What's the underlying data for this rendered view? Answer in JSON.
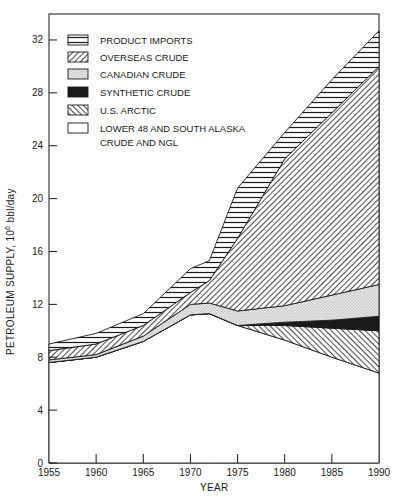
{
  "chart_data": {
    "type": "area",
    "stacked": true,
    "title": "",
    "xlabel": "YEAR",
    "ylabel": "PETROLEUM SUPPLY, 10^6 bbl/day",
    "ylabel_parts": {
      "main": "PETROLEUM SUPPLY, 10",
      "sup": "6",
      "unit": " bbl/day"
    },
    "xlim": [
      1955,
      1990
    ],
    "ylim": [
      0,
      33.5
    ],
    "x_ticks": [
      1955,
      1960,
      1965,
      1970,
      1975,
      1980,
      1985,
      1990
    ],
    "y_ticks": [
      0,
      4,
      8,
      12,
      16,
      20,
      24,
      28,
      32
    ],
    "grid": false,
    "legend_position": "upper-left inside",
    "x": [
      1955,
      1960,
      1965,
      1970,
      1972,
      1975,
      1980,
      1985,
      1990
    ],
    "series": [
      {
        "name": "LOWER 48 AND SOUTH ALASKA CRUDE AND NGL",
        "pattern": "blank",
        "values": [
          7.6,
          8.0,
          9.2,
          11.2,
          11.3,
          10.4,
          9.3,
          8.0,
          6.8
        ]
      },
      {
        "name": "U.S. ARCTIC",
        "pattern": "back-hatch",
        "values": [
          0,
          0,
          0,
          0,
          0,
          0.0,
          1.1,
          2.2,
          3.2
        ]
      },
      {
        "name": "SYNTHETIC CRUDE",
        "pattern": "solid-black",
        "values": [
          0,
          0,
          0,
          0,
          0,
          0,
          0.25,
          0.6,
          1.1
        ]
      },
      {
        "name": "CANADIAN CRUDE",
        "pattern": "stipple",
        "values": [
          0.2,
          0.2,
          0.4,
          0.8,
          0.8,
          1.1,
          1.25,
          1.9,
          2.4
        ]
      },
      {
        "name": "OVERSEAS CRUDE",
        "pattern": "forward-hatch",
        "values": [
          0.7,
          0.8,
          0.8,
          0.9,
          1.7,
          5.5,
          11.1,
          13.8,
          16.5
        ]
      },
      {
        "name": "PRODUCT IMPORTS",
        "pattern": "horizontal-lines",
        "values": [
          0.5,
          0.8,
          0.9,
          1.8,
          1.5,
          3.8,
          2.0,
          2.5,
          2.7
        ]
      }
    ],
    "cumulative_tops": {
      "lower48": [
        7.6,
        8.0,
        9.2,
        11.2,
        11.3,
        10.4,
        9.3,
        8.0,
        6.8
      ],
      "arctic": [
        7.6,
        8.0,
        9.2,
        11.2,
        11.3,
        10.4,
        10.4,
        10.2,
        10.0
      ],
      "synthetic": [
        7.6,
        8.0,
        9.2,
        11.2,
        11.3,
        10.4,
        10.65,
        10.8,
        11.1
      ],
      "canadian": [
        7.8,
        8.2,
        9.6,
        12.0,
        12.1,
        11.5,
        11.9,
        12.7,
        13.5
      ],
      "overseas": [
        8.5,
        9.0,
        10.4,
        12.9,
        13.8,
        17.0,
        23.0,
        26.5,
        30.0
      ],
      "product": [
        9.0,
        9.8,
        11.3,
        14.7,
        15.3,
        20.8,
        25.0,
        29.0,
        32.7
      ]
    }
  },
  "legend": {
    "items": [
      {
        "label": "PRODUCT IMPORTS",
        "pattern": "horizontal-lines"
      },
      {
        "label": "OVERSEAS CRUDE",
        "pattern": "forward-hatch"
      },
      {
        "label": "CANADIAN CRUDE",
        "pattern": "stipple"
      },
      {
        "label": "SYNTHETIC CRUDE",
        "pattern": "solid-black"
      },
      {
        "label": "U.S. ARCTIC",
        "pattern": "back-hatch"
      },
      {
        "label": "LOWER 48 AND SOUTH ALASKA",
        "label2": "CRUDE AND NGL",
        "pattern": "blank"
      }
    ]
  },
  "axes": {
    "x_tick_labels": [
      "1955",
      "1960",
      "1965",
      "1970",
      "1975",
      "1980",
      "1985",
      "1990"
    ],
    "y_tick_labels": [
      "0",
      "4",
      "8",
      "12",
      "16",
      "20",
      "24",
      "28",
      "32"
    ],
    "xlabel": "YEAR"
  },
  "colors": {
    "ink": "#1a1a1a",
    "paper": "#ffffff",
    "stipple": "#d8d8d8"
  }
}
